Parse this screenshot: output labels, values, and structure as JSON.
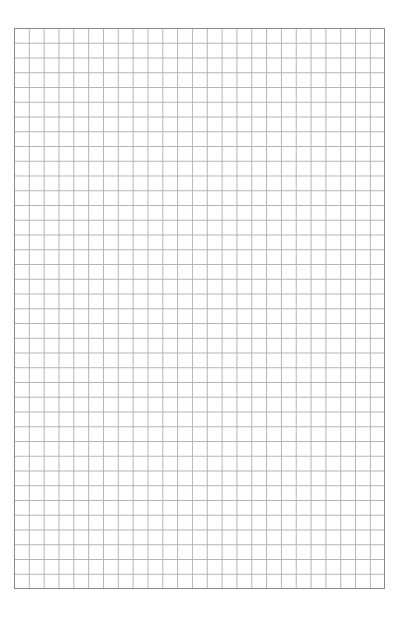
{
  "page": {
    "type": "graph-paper",
    "grid": {
      "columns": 25,
      "rows": 38,
      "line_color": "#b4b4b4",
      "border_color": "#8a8a8a",
      "background": "#ffffff"
    }
  }
}
